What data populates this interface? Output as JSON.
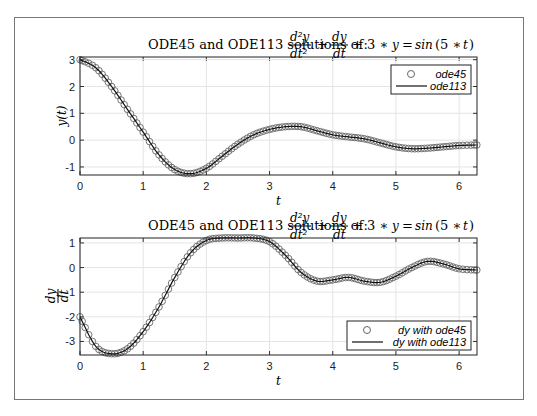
{
  "chart_data": [
    {
      "type": "line",
      "title": "ODE45 and ODE113 solutions of: d^2y/dt^2 + dy/dt + 3*y = sin(5*t)",
      "title_prefix": "ODE45 and ODE113 solutions of:",
      "xlabel": "t",
      "ylabel": "y(t)",
      "xlim": [
        0,
        6.283
      ],
      "ylim": [
        -1.3,
        3.1
      ],
      "xticks": [
        0,
        1,
        2,
        3,
        4,
        5,
        6
      ],
      "yticks": [
        -1,
        0,
        1,
        2,
        3
      ],
      "grid": true,
      "legend_position": "northeast",
      "legend": [
        "ode45",
        "ode113"
      ],
      "series": [
        {
          "name": "ode45",
          "marker": "circle",
          "x": [
            0,
            0.25,
            0.5,
            0.75,
            1.0,
            1.25,
            1.5,
            1.75,
            2.0,
            2.25,
            2.5,
            2.75,
            3.0,
            3.25,
            3.5,
            3.75,
            4.0,
            4.25,
            4.5,
            4.75,
            5.0,
            5.25,
            5.5,
            5.75,
            6.0,
            6.28
          ],
          "y": [
            3.0,
            2.7,
            2.0,
            1.15,
            0.3,
            -0.55,
            -1.1,
            -1.25,
            -1.05,
            -0.6,
            -0.15,
            0.2,
            0.4,
            0.5,
            0.5,
            0.35,
            0.2,
            0.12,
            0.05,
            -0.1,
            -0.25,
            -0.32,
            -0.3,
            -0.25,
            -0.2,
            -0.18
          ]
        },
        {
          "name": "ode113",
          "marker": "line",
          "x": [
            0,
            0.25,
            0.5,
            0.75,
            1.0,
            1.25,
            1.5,
            1.75,
            2.0,
            2.25,
            2.5,
            2.75,
            3.0,
            3.25,
            3.5,
            3.75,
            4.0,
            4.25,
            4.5,
            4.75,
            5.0,
            5.25,
            5.5,
            5.75,
            6.0,
            6.28
          ],
          "y": [
            3.0,
            2.7,
            2.0,
            1.15,
            0.3,
            -0.55,
            -1.1,
            -1.25,
            -1.05,
            -0.6,
            -0.15,
            0.2,
            0.4,
            0.5,
            0.5,
            0.35,
            0.2,
            0.12,
            0.05,
            -0.1,
            -0.25,
            -0.32,
            -0.3,
            -0.25,
            -0.2,
            -0.18
          ]
        }
      ]
    },
    {
      "type": "line",
      "title": "ODE45 and ODE113 solutions of: d^2y/dt^2 + dy/dt + 3*y = sin(5*t)",
      "title_prefix": "ODE45 and ODE113 solutions of:",
      "xlabel": "t",
      "ylabel": "dy/dt",
      "xlim": [
        0,
        6.283
      ],
      "ylim": [
        -3.55,
        1.2
      ],
      "xticks": [
        0,
        1,
        2,
        3,
        4,
        5,
        6
      ],
      "yticks": [
        -3,
        -2,
        -1,
        0,
        1
      ],
      "grid": true,
      "legend_position": "southeast",
      "legend": [
        "dy with ode45",
        "dy with ode113"
      ],
      "series": [
        {
          "name": "dy with ode45",
          "marker": "circle",
          "x": [
            0,
            0.25,
            0.5,
            0.75,
            1.0,
            1.25,
            1.5,
            1.75,
            2.0,
            2.25,
            2.5,
            2.75,
            3.0,
            3.25,
            3.5,
            3.75,
            4.0,
            4.25,
            4.5,
            4.75,
            5.0,
            5.25,
            5.5,
            5.75,
            6.0,
            6.28
          ],
          "y": [
            -2.0,
            -3.2,
            -3.5,
            -3.3,
            -2.6,
            -1.6,
            -0.4,
            0.6,
            1.1,
            1.2,
            1.2,
            1.2,
            1.05,
            0.5,
            -0.2,
            -0.55,
            -0.5,
            -0.4,
            -0.55,
            -0.6,
            -0.35,
            0.0,
            0.25,
            0.15,
            -0.05,
            -0.1
          ]
        },
        {
          "name": "dy with ode113",
          "marker": "line",
          "x": [
            0,
            0.25,
            0.5,
            0.75,
            1.0,
            1.25,
            1.5,
            1.75,
            2.0,
            2.25,
            2.5,
            2.75,
            3.0,
            3.25,
            3.5,
            3.75,
            4.0,
            4.25,
            4.5,
            4.75,
            5.0,
            5.25,
            5.5,
            5.75,
            6.0,
            6.28
          ],
          "y": [
            -2.0,
            -3.2,
            -3.5,
            -3.3,
            -2.6,
            -1.6,
            -0.4,
            0.6,
            1.1,
            1.2,
            1.2,
            1.2,
            1.05,
            0.5,
            -0.2,
            -0.55,
            -0.5,
            -0.4,
            -0.55,
            -0.6,
            -0.35,
            0.0,
            0.25,
            0.15,
            -0.05,
            -0.1
          ]
        }
      ]
    }
  ],
  "labels": {
    "title_prefix": "ODE45 and ODE113 solutions of:",
    "top_xlabel": "t",
    "top_ylabel": "y(t)",
    "bottom_xlabel": "t",
    "bottom_ylabel_num": "dy",
    "bottom_ylabel_den": "dt",
    "top_legend": [
      "ode45",
      "ode113"
    ],
    "bottom_legend": [
      "dy with ode45",
      "dy with ode113"
    ]
  }
}
